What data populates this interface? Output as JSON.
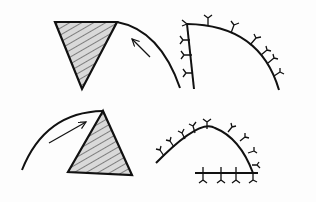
{
  "diagram": {
    "type": "line-drawing",
    "panels": [
      {
        "id": "top-left",
        "description": "Hatched triangle with curved path and arrow pointing toward apex"
      },
      {
        "id": "top-right",
        "description": "Vertical stroke meeting curved arc, both decorated with Y-shaped tick marks"
      },
      {
        "id": "bottom-left",
        "description": "Curved path rising to apex of hatched triangle with arrow"
      },
      {
        "id": "bottom-right",
        "description": "Arched curve with Y-shaped tick marks ending at horizontal line with ticks"
      }
    ],
    "colors": {
      "stroke": "#111111",
      "hatch_fill": "#d9d9d9",
      "background": "#fdfdfd"
    }
  }
}
